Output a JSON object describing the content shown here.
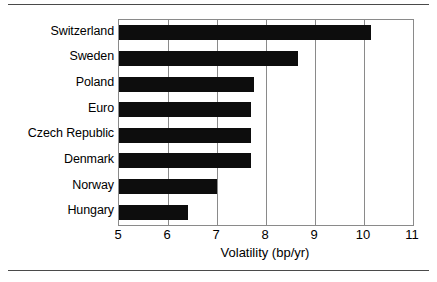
{
  "chart_data": {
    "type": "bar",
    "orientation": "horizontal",
    "title": "",
    "subtitle": "",
    "xlabel": "Volatility (bp/yr)",
    "ylabel": "",
    "categories": [
      "Switzerland",
      "Sweden",
      "Poland",
      "Euro",
      "Czech Republic",
      "Denmark",
      "Norway",
      "Hungary"
    ],
    "values": [
      10.15,
      8.65,
      7.75,
      7.7,
      7.7,
      7.7,
      7.0,
      6.4
    ],
    "series": [
      {
        "name": "Volatility",
        "values": [
          10.15,
          8.65,
          7.75,
          7.7,
          7.7,
          7.7,
          7.0,
          6.4
        ]
      }
    ],
    "xlim": [
      5,
      11
    ],
    "xticks": [
      5,
      6,
      7,
      8,
      9,
      10,
      11
    ],
    "xtick_labels": [
      "5",
      "6",
      "7",
      "8",
      "9",
      "10",
      "11"
    ],
    "grid": true,
    "grid_axis": "x",
    "legend": false,
    "legend_position": "none",
    "bar_color": "#0d0d0d",
    "grid_color": "#8a8a8a",
    "axis_color": "#8a8a8a",
    "background_color": "#ffffff"
  },
  "figure": {
    "top_rule_color": "#4a4a4a",
    "bottom_rule_color": "#4a4a4a"
  }
}
